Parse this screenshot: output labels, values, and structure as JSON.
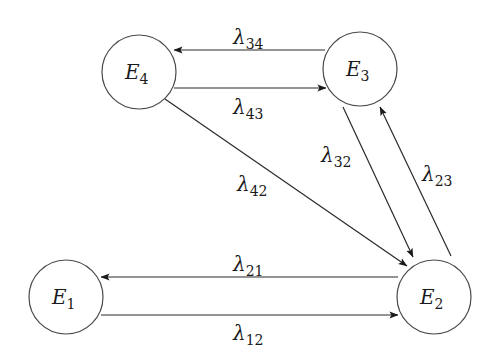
{
  "diagram": {
    "type": "state-transition",
    "colors": {
      "stroke": "#2a2a2a",
      "circle_stroke": "#4a4a4a",
      "background": "#ffffff"
    },
    "nodes": [
      {
        "id": "E1",
        "letter": "E",
        "sub": "1",
        "cx": 66,
        "cy": 297,
        "r": 37
      },
      {
        "id": "E2",
        "letter": "E",
        "sub": "2",
        "cx": 434,
        "cy": 297,
        "r": 37
      },
      {
        "id": "E3",
        "letter": "E",
        "sub": "3",
        "cx": 360,
        "cy": 69,
        "r": 37
      },
      {
        "id": "E4",
        "letter": "E",
        "sub": "4",
        "cx": 139,
        "cy": 72,
        "r": 37
      }
    ],
    "edges": [
      {
        "id": "l34",
        "from": "E3",
        "to": "E4",
        "symbol": "λ",
        "sub": "34",
        "x1": 325,
        "y1": 50,
        "x2": 174,
        "y2": 50,
        "lx": 233,
        "ly": 44
      },
      {
        "id": "l43",
        "from": "E4",
        "to": "E3",
        "symbol": "λ",
        "sub": "43",
        "x1": 174,
        "y1": 88,
        "x2": 326,
        "y2": 88,
        "lx": 233,
        "ly": 114
      },
      {
        "id": "l42",
        "from": "E4",
        "to": "E2",
        "symbol": "λ",
        "sub": "42",
        "x1": 165,
        "y1": 99,
        "x2": 407,
        "y2": 266,
        "lx": 237,
        "ly": 191
      },
      {
        "id": "l32",
        "from": "E3",
        "to": "E2",
        "symbol": "λ",
        "sub": "32",
        "x1": 343,
        "y1": 107,
        "x2": 413,
        "y2": 257,
        "lx": 321,
        "ly": 162
      },
      {
        "id": "l23",
        "from": "E2",
        "to": "E3",
        "symbol": "λ",
        "sub": "23",
        "x1": 451,
        "y1": 256,
        "x2": 380,
        "y2": 107,
        "lx": 422,
        "ly": 181
      },
      {
        "id": "l21",
        "from": "E2",
        "to": "E1",
        "symbol": "λ",
        "sub": "21",
        "x1": 398,
        "y1": 277,
        "x2": 101,
        "y2": 277,
        "lx": 233,
        "ly": 271
      },
      {
        "id": "l12",
        "from": "E1",
        "to": "E2",
        "symbol": "λ",
        "sub": "12",
        "x1": 101,
        "y1": 315,
        "x2": 398,
        "y2": 315,
        "lx": 233,
        "ly": 340
      }
    ]
  }
}
